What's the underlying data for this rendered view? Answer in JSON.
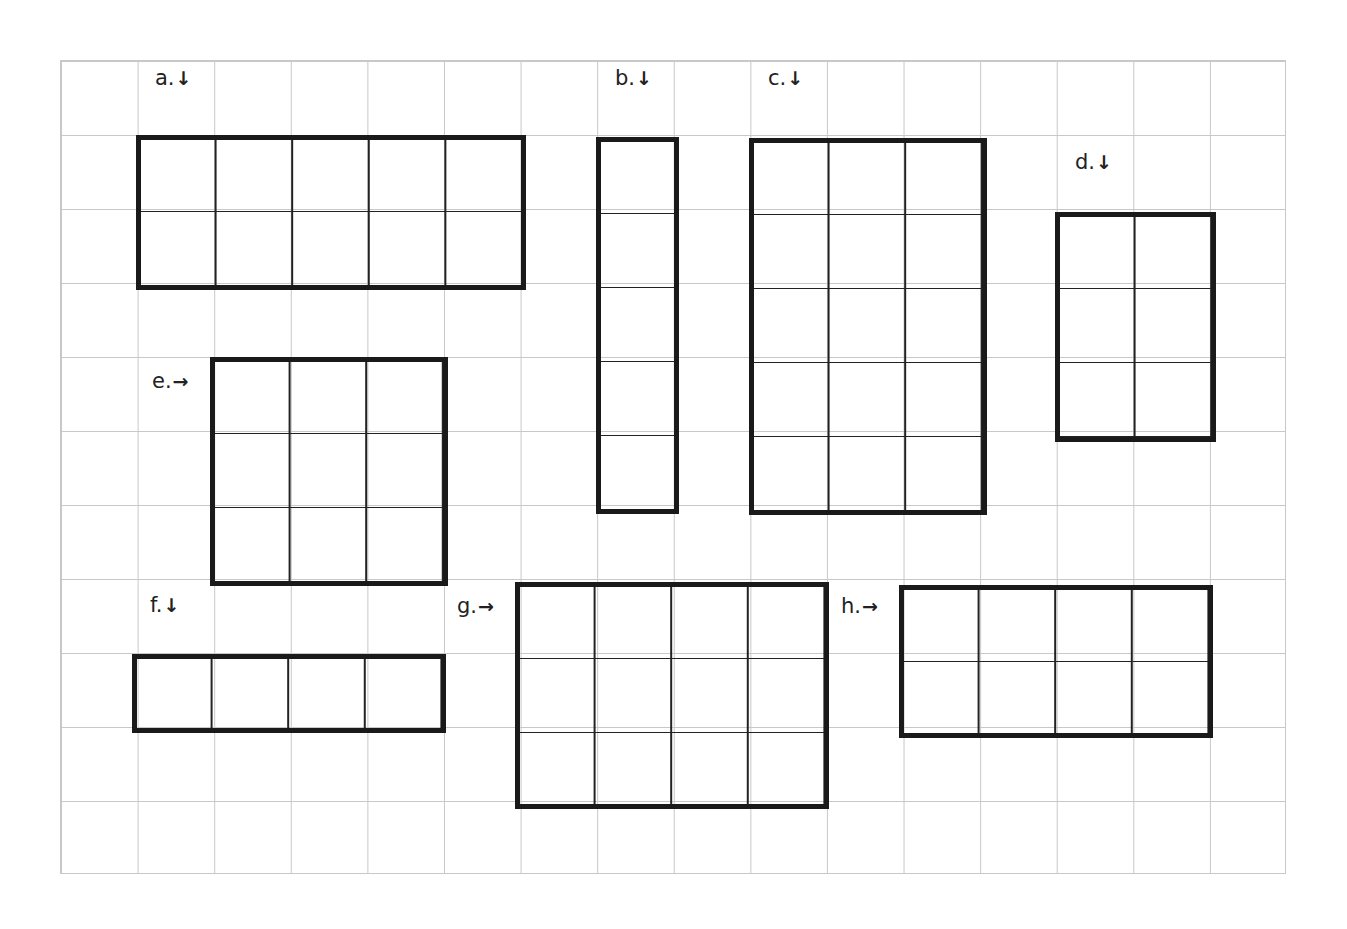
{
  "grid": {
    "columns": 16,
    "rows": 11,
    "line_color": "#c8c8c8"
  },
  "rectangles": [
    {
      "id": "a",
      "label": "a.",
      "arrow": "↓",
      "arrow_icon": "down-arrow-icon",
      "cols": 5,
      "rows": 2
    },
    {
      "id": "b",
      "label": "b.",
      "arrow": "↓",
      "arrow_icon": "down-arrow-icon",
      "cols": 1,
      "rows": 5
    },
    {
      "id": "c",
      "label": "c.",
      "arrow": "↓",
      "arrow_icon": "down-arrow-icon",
      "cols": 3,
      "rows": 5
    },
    {
      "id": "d",
      "label": "d.",
      "arrow": "↓",
      "arrow_icon": "down-arrow-icon",
      "cols": 2,
      "rows": 3
    },
    {
      "id": "e",
      "label": "e.",
      "arrow": "→",
      "arrow_icon": "right-arrow-icon",
      "cols": 3,
      "rows": 3
    },
    {
      "id": "f",
      "label": "f.",
      "arrow": "↓",
      "arrow_icon": "down-arrow-icon",
      "cols": 4,
      "rows": 1
    },
    {
      "id": "g",
      "label": "g.",
      "arrow": "→",
      "arrow_icon": "right-arrow-icon",
      "cols": 4,
      "rows": 3
    },
    {
      "id": "h",
      "label": "h.",
      "arrow": "→",
      "arrow_icon": "right-arrow-icon",
      "cols": 4,
      "rows": 2
    }
  ]
}
